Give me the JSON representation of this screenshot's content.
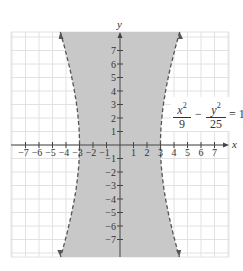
{
  "chart_data": {
    "type": "line",
    "title": "",
    "xlabel": "x",
    "ylabel": "y",
    "xlim": [
      -8,
      8
    ],
    "ylim": [
      -8,
      8
    ],
    "grid": true,
    "x_ticks": [
      "-7",
      "-6",
      "-5",
      "-4",
      "-3",
      "-2",
      "-1",
      "1",
      "2",
      "3",
      "4",
      "5",
      "6",
      "7"
    ],
    "y_ticks": [
      "7",
      "6",
      "5",
      "4",
      "3",
      "2",
      "1",
      "-1",
      "-2",
      "-3",
      "-4",
      "-5",
      "-6",
      "-7"
    ],
    "equation": {
      "term1_num": "x",
      "term1_num_exp": "2",
      "term1_den": "9",
      "operator": "−",
      "term2_num": "y",
      "term2_num_exp": "2",
      "term2_den": "25",
      "rhs": "= 1"
    },
    "series": [
      {
        "name": "left branch",
        "style": "dashed",
        "points": [
          [
            -4.4,
            8.3
          ],
          [
            -3.8,
            6
          ],
          [
            -3.3,
            3.5
          ],
          [
            -3,
            0
          ],
          [
            -3.3,
            -3.5
          ],
          [
            -3.8,
            -6
          ],
          [
            -4.4,
            -8.3
          ]
        ]
      },
      {
        "name": "right branch",
        "style": "dashed",
        "points": [
          [
            4.4,
            8.3
          ],
          [
            3.8,
            6
          ],
          [
            3.3,
            3.5
          ],
          [
            3,
            0
          ],
          [
            3.3,
            -3.5
          ],
          [
            3.8,
            -6
          ],
          [
            4.4,
            -8.3
          ]
        ]
      }
    ],
    "shaded_region": "between the two branches (x^2/9 - y^2/25 < 1)",
    "colors": {
      "shade": "#c8c8c8",
      "grid": "#e2e2e2",
      "axis": "#444444",
      "curve": "#555555"
    }
  }
}
